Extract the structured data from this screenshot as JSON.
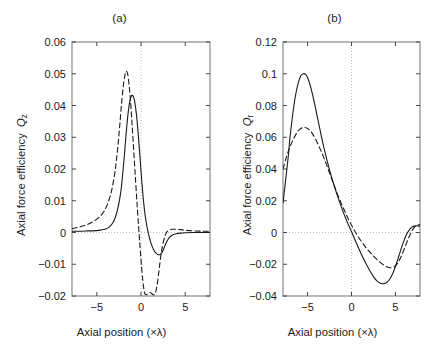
{
  "figure": {
    "width": 430,
    "height": 355,
    "background": "#ffffff",
    "line_color": "#1a1a1a",
    "grid_color": "#bdbdbd"
  },
  "panels": {
    "a": {
      "title": "(a)",
      "xlabel": "Axial position (×λ)",
      "ylabel_text": "Axial force efficiency",
      "ylabel_symbol": "Q",
      "ylabel_subscript": "z",
      "ylabel_full": "Axial force efficiency Qz"
    },
    "b": {
      "title": "(b)",
      "xlabel": "Axial position (×λ)",
      "ylabel_text": "Axial force efficiency",
      "ylabel_symbol": "Q",
      "ylabel_subscript": "r",
      "ylabel_full": "Axial force efficiency Qr"
    }
  },
  "chart_data": [
    {
      "id": "panel-a",
      "type": "line",
      "title": "(a)",
      "xlabel": "Axial position (×λ)",
      "ylabel": "Axial force efficiency Q_z",
      "xlim": [
        -7.8,
        7.8
      ],
      "ylim": [
        -0.02,
        0.06
      ],
      "xticks": [
        -5,
        0,
        5
      ],
      "xtick_labels": [
        "−5",
        "0",
        "5"
      ],
      "yticks": [
        -0.02,
        -0.01,
        0,
        0.01,
        0.02,
        0.03,
        0.04,
        0.05,
        0.06
      ],
      "ytick_labels": [
        "−0.02",
        "−0.01",
        "0",
        "0.01",
        "0.02",
        "0.03",
        "0.04",
        "0.05",
        "0.06"
      ],
      "grid": "dotted-zero-lines",
      "gridlines": {
        "vertical_at_x": 0,
        "horizontal_at_y": 0
      },
      "legend": null,
      "series": [
        {
          "name": "solid",
          "style": "solid",
          "x": [
            -7.8,
            -7.0,
            -6.0,
            -5.0,
            -4.5,
            -4.0,
            -3.6,
            -3.2,
            -2.9,
            -2.6,
            -2.3,
            -2.1,
            -1.9,
            -1.7,
            -1.5,
            -1.3,
            -1.1,
            -1.0,
            -0.85,
            -0.7,
            -0.5,
            -0.3,
            -0.1,
            0.1,
            0.3,
            0.5,
            0.7,
            0.9,
            1.1,
            1.3,
            1.5,
            1.7,
            1.9,
            2.1,
            2.3,
            2.5,
            2.7,
            2.9,
            3.2,
            3.6,
            4.0,
            4.5,
            5.0,
            6.0,
            7.0,
            7.8
          ],
          "y": [
            0.0004,
            0.0004,
            0.0005,
            0.0006,
            0.0008,
            0.0011,
            0.0017,
            0.003,
            0.0048,
            0.0078,
            0.0125,
            0.0175,
            0.0235,
            0.0305,
            0.0365,
            0.0408,
            0.0429,
            0.0432,
            0.0428,
            0.041,
            0.0368,
            0.0305,
            0.0232,
            0.0158,
            0.0095,
            0.0048,
            0.0015,
            -0.001,
            -0.0031,
            -0.0046,
            -0.0058,
            -0.0065,
            -0.0069,
            -0.007,
            -0.0066,
            -0.0056,
            -0.0042,
            -0.0029,
            -0.0016,
            -0.0007,
            -0.0004,
            -0.0002,
            -0.0001,
            0.0,
            0.0,
            0.0
          ]
        },
        {
          "name": "dashed",
          "style": "dashed",
          "x": [
            -7.8,
            -7.0,
            -6.5,
            -6.0,
            -5.5,
            -5.0,
            -4.5,
            -4.2,
            -3.9,
            -3.6,
            -3.3,
            -3.0,
            -2.8,
            -2.6,
            -2.4,
            -2.2,
            -2.0,
            -1.8,
            -1.65,
            -1.5,
            -1.35,
            -1.2,
            -1.0,
            -0.8,
            -0.6,
            -0.4,
            -0.2,
            0.0,
            0.2,
            0.4,
            0.6,
            0.8,
            1.0,
            1.2,
            1.4,
            1.6,
            1.8,
            2.0,
            2.2,
            2.4,
            2.7,
            3.0,
            3.5,
            4.0,
            4.5,
            5.0,
            6.0,
            7.0,
            7.8
          ],
          "y": [
            0.0012,
            0.0017,
            0.0021,
            0.0026,
            0.0033,
            0.0042,
            0.0055,
            0.0066,
            0.0082,
            0.0104,
            0.0135,
            0.018,
            0.0222,
            0.0275,
            0.0338,
            0.0405,
            0.0462,
            0.0498,
            0.0508,
            0.0498,
            0.0465,
            0.042,
            0.0338,
            0.0248,
            0.0158,
            0.0072,
            -0.001,
            -0.0085,
            -0.015,
            -0.019,
            -0.0196,
            -0.0192,
            -0.0189,
            -0.0192,
            -0.0196,
            -0.0192,
            -0.017,
            -0.0128,
            -0.0082,
            -0.0045,
            -0.0012,
            0.0004,
            0.001,
            0.001,
            0.0009,
            0.0007,
            0.0005,
            0.0004,
            0.0004
          ]
        }
      ],
      "annotations": {
        "solid_peak": {
          "x": -1.0,
          "y": 0.043
        },
        "solid_trough": {
          "x": 2.1,
          "y": -0.007
        },
        "dashed_peak": {
          "x": -1.6,
          "y": 0.051
        },
        "dashed_trough": {
          "x": 1.5,
          "y": -0.0196
        }
      }
    },
    {
      "id": "panel-b",
      "type": "line",
      "title": "(b)",
      "xlabel": "Axial position (×λ)",
      "ylabel": "Axial force efficiency Q_r",
      "xlim": [
        -7.8,
        7.8
      ],
      "ylim": [
        -0.04,
        0.12
      ],
      "xticks": [
        -5,
        0,
        5
      ],
      "xtick_labels": [
        "−5",
        "0",
        "5"
      ],
      "yticks": [
        -0.04,
        -0.02,
        0,
        0.02,
        0.04,
        0.06,
        0.08,
        0.1,
        0.12
      ],
      "ytick_labels": [
        "−0.04",
        "−0.02",
        "0",
        "0.02",
        "0.04",
        "0.06",
        "0.08",
        "0.1",
        "0.12"
      ],
      "grid": "dotted-zero-lines",
      "gridlines": {
        "vertical_at_x": 0,
        "horizontal_at_y": 0
      },
      "legend": null,
      "series": [
        {
          "name": "solid",
          "style": "solid",
          "x": [
            -7.8,
            -7.5,
            -7.2,
            -7.0,
            -6.7,
            -6.4,
            -6.1,
            -5.8,
            -5.5,
            -5.2,
            -5.0,
            -4.8,
            -4.5,
            -4.2,
            -3.9,
            -3.5,
            -3.1,
            -2.7,
            -2.3,
            -1.9,
            -1.5,
            -1.1,
            -0.7,
            -0.3,
            0.1,
            0.5,
            0.9,
            1.3,
            1.7,
            2.1,
            2.5,
            2.9,
            3.3,
            3.7,
            4.0,
            4.3,
            4.7,
            5.1,
            5.5,
            5.9,
            6.3,
            6.7,
            7.0,
            7.3,
            7.6,
            7.8
          ],
          "y": [
            0.0185,
            0.033,
            0.048,
            0.06,
            0.074,
            0.0855,
            0.0935,
            0.0985,
            0.1,
            0.0995,
            0.0975,
            0.0945,
            0.0885,
            0.081,
            0.073,
            0.0625,
            0.0525,
            0.0435,
            0.0355,
            0.0282,
            0.0215,
            0.0152,
            0.0095,
            0.0042,
            -0.0008,
            -0.006,
            -0.011,
            -0.0158,
            -0.0202,
            -0.0242,
            -0.0278,
            -0.0305,
            -0.032,
            -0.0322,
            -0.0315,
            -0.0298,
            -0.0258,
            -0.0198,
            -0.013,
            -0.0062,
            -0.0008,
            0.0025,
            0.0038,
            0.0042,
            0.0041,
            0.004
          ]
        },
        {
          "name": "dashed",
          "style": "dashed",
          "x": [
            -7.8,
            -7.4,
            -7.0,
            -6.6,
            -6.2,
            -5.9,
            -5.6,
            -5.3,
            -5.0,
            -4.7,
            -4.4,
            -4.0,
            -3.6,
            -3.2,
            -2.8,
            -2.4,
            -2.0,
            -1.6,
            -1.2,
            -0.8,
            -0.4,
            0.0,
            0.4,
            0.8,
            1.2,
            1.6,
            2.0,
            2.4,
            2.8,
            3.2,
            3.6,
            4.0,
            4.4,
            4.8,
            5.2,
            5.6,
            6.0,
            6.4,
            6.8,
            7.2,
            7.6,
            7.8
          ],
          "y": [
            0.04,
            0.0478,
            0.054,
            0.059,
            0.063,
            0.065,
            0.066,
            0.0662,
            0.0655,
            0.064,
            0.0618,
            0.0578,
            0.053,
            0.0478,
            0.042,
            0.036,
            0.03,
            0.0242,
            0.0188,
            0.0138,
            0.009,
            0.0046,
            0.0006,
            -0.003,
            -0.0062,
            -0.0092,
            -0.0118,
            -0.0142,
            -0.0165,
            -0.0185,
            -0.0202,
            -0.0215,
            -0.0222,
            -0.0218,
            -0.0198,
            -0.0158,
            -0.0105,
            -0.0048,
            0.0002,
            0.0035,
            0.0048,
            0.005
          ]
        }
      ],
      "annotations": {
        "solid_peak": {
          "x": -5.0,
          "y": 0.1
        },
        "solid_trough": {
          "x": 3.8,
          "y": -0.032
        },
        "dashed_peak": {
          "x": -5.3,
          "y": 0.066
        },
        "dashed_trough": {
          "x": 4.4,
          "y": -0.022
        }
      }
    }
  ]
}
